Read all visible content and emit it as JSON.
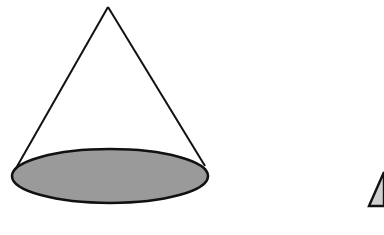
{
  "diagram": {
    "background": "#ffffff",
    "stroke_color": "#111111",
    "shapes": [
      {
        "name": "cone",
        "apex": [
          108,
          7
        ],
        "base_ellipse": {
          "cx": 110,
          "cy": 176,
          "rx": 98,
          "ry": 27,
          "fill": "#9a9a9a"
        },
        "left_tangent": [
          15,
          170
        ],
        "right_tangent": [
          205,
          166
        ]
      },
      {
        "name": "partial-pyramid",
        "points": [
          [
            369,
            206
          ],
          [
            384,
            172
          ],
          [
            384,
            206
          ]
        ],
        "fill": "#cfcfcf",
        "clipped_at_right_edge": true
      }
    ]
  }
}
